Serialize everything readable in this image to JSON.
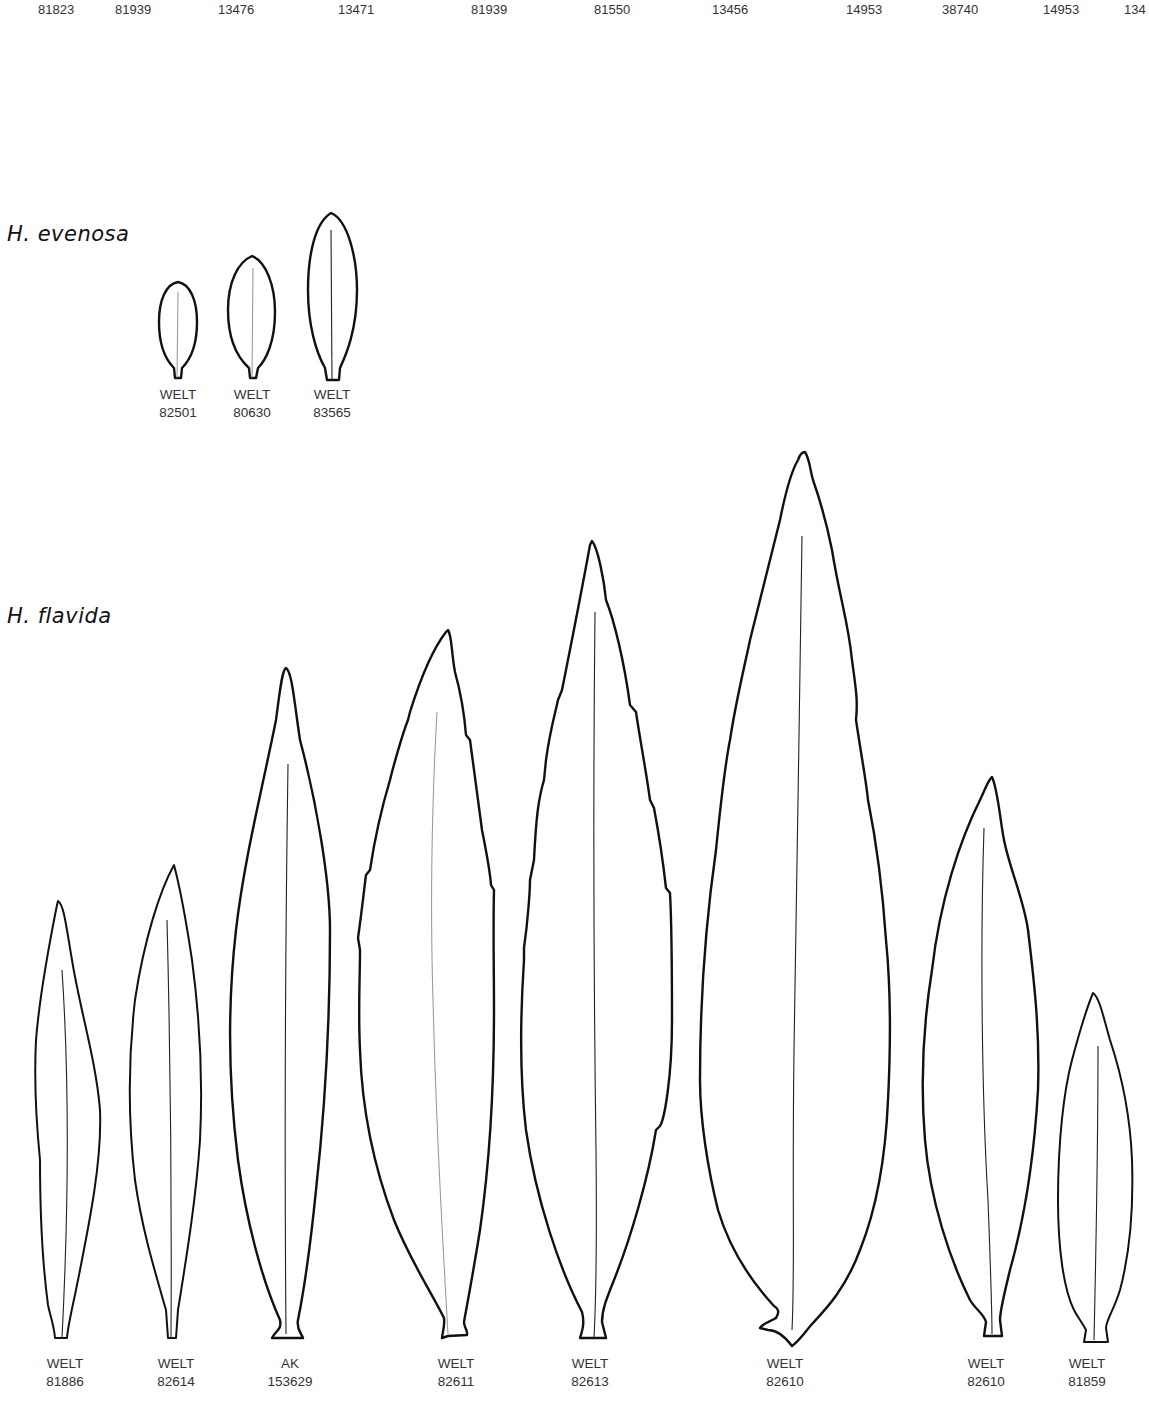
{
  "top_row_numbers": [
    {
      "text": "81823",
      "x": 38
    },
    {
      "text": "81939",
      "x": 115
    },
    {
      "text": "13476",
      "x": 218
    },
    {
      "text": "13471",
      "x": 338
    },
    {
      "text": "81939",
      "x": 471
    },
    {
      "text": "81550",
      "x": 594
    },
    {
      "text": "13456",
      "x": 712
    },
    {
      "text": "14953",
      "x": 846
    },
    {
      "text": "38740",
      "x": 942
    },
    {
      "text": "14953",
      "x": 1043
    },
    {
      "text": "134",
      "x": 1124
    }
  ],
  "species": [
    {
      "name": "H. evenosa",
      "specimens": [
        {
          "herbarium": "WELT",
          "number": "82501"
        },
        {
          "herbarium": "WELT",
          "number": "80630"
        },
        {
          "herbarium": "WELT",
          "number": "83565"
        }
      ]
    },
    {
      "name": "H. flavida",
      "specimens": [
        {
          "herbarium": "WELT",
          "number": "81886"
        },
        {
          "herbarium": "WELT",
          "number": "82614"
        },
        {
          "herbarium": "AK",
          "number": "153629"
        },
        {
          "herbarium": "WELT",
          "number": "82611"
        },
        {
          "herbarium": "WELT",
          "number": "82613"
        },
        {
          "herbarium": "WELT",
          "number": "82610"
        },
        {
          "herbarium": "WELT",
          "number": "82610"
        },
        {
          "herbarium": "WELT",
          "number": "81859"
        }
      ]
    }
  ],
  "colors": {
    "outline": "#111111",
    "text": "#333333",
    "background": "#ffffff"
  }
}
